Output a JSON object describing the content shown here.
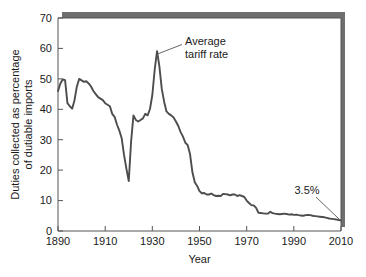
{
  "chart_data": {
    "type": "line",
    "title": "",
    "xlabel": "Year",
    "ylabel": "Duties collected as percentage of dutiable imports",
    "ylabel_line1": "Duties collected as percentage",
    "ylabel_line2": "of dutiable imports",
    "xlim": [
      1890,
      2010
    ],
    "ylim": [
      0,
      70
    ],
    "grid": false,
    "legend": "none",
    "xticks": [
      "1890",
      "1910",
      "1930",
      "1950",
      "1970",
      "1990",
      "2010"
    ],
    "xtick_values": [
      1890,
      1910,
      1930,
      1950,
      1970,
      1990,
      2010
    ],
    "yticks": [
      "0",
      "10",
      "20",
      "30",
      "40",
      "50",
      "60",
      "70"
    ],
    "ytick_values": [
      0,
      10,
      20,
      30,
      40,
      50,
      60,
      70
    ],
    "series": [
      {
        "name": "Average tariff rate",
        "color": "#4d4d4d",
        "x": [
          1890,
          1891,
          1892,
          1893,
          1894,
          1895,
          1896,
          1897,
          1898,
          1899,
          1900,
          1901,
          1902,
          1903,
          1904,
          1905,
          1906,
          1907,
          1908,
          1909,
          1910,
          1911,
          1912,
          1913,
          1914,
          1915,
          1916,
          1917,
          1918,
          1919,
          1920,
          1921,
          1922,
          1923,
          1924,
          1925,
          1926,
          1927,
          1928,
          1929,
          1930,
          1931,
          1932,
          1933,
          1934,
          1935,
          1936,
          1937,
          1938,
          1939,
          1940,
          1941,
          1942,
          1943,
          1944,
          1945,
          1946,
          1947,
          1948,
          1949,
          1950,
          1951,
          1952,
          1953,
          1954,
          1955,
          1956,
          1957,
          1958,
          1959,
          1960,
          1961,
          1962,
          1963,
          1964,
          1965,
          1966,
          1967,
          1968,
          1969,
          1970,
          1971,
          1972,
          1973,
          1974,
          1975,
          1976,
          1977,
          1978,
          1979,
          1980,
          1981,
          1982,
          1983,
          1984,
          1985,
          1986,
          1987,
          1988,
          1989,
          1990,
          1991,
          1992,
          1993,
          1994,
          1995,
          1996,
          1997,
          1998,
          1999,
          2000,
          2001,
          2002,
          2003,
          2004,
          2005,
          2006,
          2007,
          2008,
          2009,
          2010
        ],
        "values": [
          46.0,
          48.5,
          49.8,
          49.6,
          42.0,
          41.0,
          40.2,
          43.0,
          47.5,
          50.0,
          49.5,
          49.0,
          49.2,
          48.5,
          47.5,
          46.0,
          45.0,
          44.0,
          43.5,
          43.0,
          42.0,
          41.5,
          41.0,
          38.5,
          37.5,
          35.0,
          33.0,
          30.5,
          25.0,
          20.5,
          16.4,
          29.5,
          38.0,
          36.5,
          36.0,
          36.5,
          37.0,
          38.5,
          38.0,
          40.1,
          44.7,
          53.0,
          59.1,
          54.0,
          46.7,
          42.5,
          39.3,
          38.5,
          38.0,
          37.3,
          36.0,
          34.5,
          32.5,
          31.0,
          29.0,
          28.2,
          25.2,
          19.3,
          16.0,
          14.8,
          13.1,
          12.4,
          12.5,
          12.0,
          12.0,
          12.3,
          11.8,
          11.5,
          11.6,
          11.5,
          12.2,
          12.1,
          12.0,
          11.7,
          12.0,
          12.0,
          11.5,
          11.8,
          11.5,
          11.2,
          10.0,
          9.2,
          8.5,
          8.4,
          7.6,
          6.0,
          5.9,
          5.8,
          5.7,
          5.7,
          6.3,
          5.9,
          5.7,
          5.6,
          5.5,
          5.6,
          5.7,
          5.6,
          5.4,
          5.5,
          5.3,
          5.4,
          5.2,
          5.1,
          5.0,
          5.2,
          5.3,
          5.2,
          5.0,
          4.9,
          4.8,
          4.7,
          4.6,
          4.5,
          4.3,
          4.1,
          4.0,
          3.9,
          3.8,
          3.6,
          3.5
        ]
      }
    ],
    "annotations": [
      {
        "id": "average-tariff-rate",
        "line1": "Average",
        "line2": "tariff rate",
        "points_to_year": 1932,
        "points_to_value": 57.0
      },
      {
        "id": "final-value",
        "text": "3.5%",
        "points_to_year": 2010,
        "points_to_value": 3.5
      }
    ]
  }
}
